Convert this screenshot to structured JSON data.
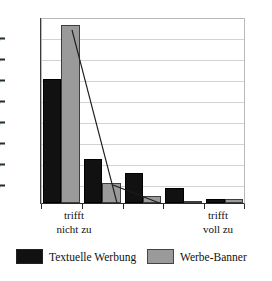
{
  "chart_data": {
    "type": "bar",
    "title": "",
    "subtitle": "",
    "xlabel": "",
    "ylabel": "",
    "categories": [
      "trifft nicht zu",
      "",
      "",
      "",
      "trifft voll zu"
    ],
    "category_lines": [
      [
        "trifft",
        "nicht zu"
      ],
      [
        "",
        ""
      ],
      [
        "",
        ""
      ],
      [
        "",
        ""
      ],
      [
        "trifft",
        "voll zu"
      ]
    ],
    "series": [
      {
        "name": "Textuelle Werbung",
        "color": "#111111",
        "values": [
          57,
          20,
          14,
          7,
          2
        ]
      },
      {
        "name": "Werbe-Banner",
        "color": "#9a9a9a",
        "values": [
          82,
          9,
          3,
          1,
          2
        ]
      }
    ],
    "ylim": [
      0,
      85
    ],
    "ytick_values": [
      10,
      20,
      30,
      40,
      50,
      60,
      70,
      80
    ],
    "ytick_labels": [
      "10%",
      "20%",
      "30%",
      "40%",
      "50%",
      "60%",
      "70%",
      "80%"
    ],
    "grid": true,
    "legend_position": "bottom",
    "annotations": [
      "diagonal connector line across Werbe-Banner bars"
    ]
  },
  "legend": {
    "items": [
      {
        "label": "Textuelle Werbung",
        "color": "#111111"
      },
      {
        "label": "Werbe-Banner",
        "color": "#9a9a9a"
      }
    ]
  },
  "axis": {
    "y_ticks": [
      "80%",
      "70%",
      "60%",
      "50%",
      "40%",
      "30%",
      "20%",
      "10%"
    ],
    "x_left_label_line1": "trifft",
    "x_left_label_line2": "nicht zu",
    "x_right_label_line1": "trifft",
    "x_right_label_line2": "voll zu"
  }
}
